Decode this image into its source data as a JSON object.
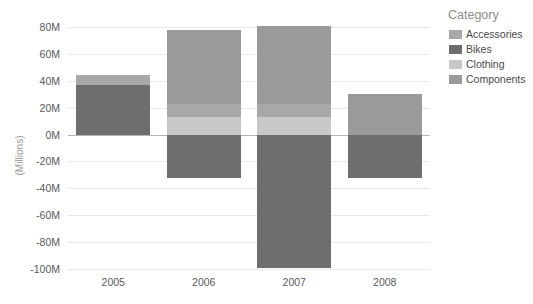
{
  "chart_data": {
    "type": "bar",
    "title": "",
    "subtitle": "",
    "xlabel": "",
    "ylabel": "(Millions)",
    "categories": [
      "2005",
      "2006",
      "2007",
      "2008"
    ],
    "ylim": [
      -100,
      80
    ],
    "ytick_values": [
      80,
      60,
      40,
      20,
      0,
      -20,
      -40,
      -60,
      -80,
      -100
    ],
    "ytick_labels": [
      "80M",
      "60M",
      "40M",
      "20M",
      "0M",
      "-20M",
      "-40M",
      "-60M",
      "-80M",
      "-100M"
    ],
    "grid": true,
    "stacked": true,
    "legend_position": "right",
    "legend_title": "Category",
    "series": [
      {
        "name": "Accessories",
        "color": "#a8a8a8",
        "values": [
          7,
          10,
          10,
          0
        ]
      },
      {
        "name": "Bikes",
        "color": "#6e6e6e",
        "values": [
          37,
          -32,
          -99,
          -32
        ]
      },
      {
        "name": "Clothing",
        "color": "#c8c8c8",
        "values": [
          0,
          13,
          13,
          0
        ]
      },
      {
        "name": "Components",
        "color": "#9a9a9a",
        "values": [
          0,
          55,
          58,
          30
        ]
      }
    ],
    "bar_totals_positive": [
      44,
      78,
      81,
      30
    ],
    "bar_totals_negative": [
      0,
      -32,
      -99,
      -32
    ]
  },
  "legend": {
    "title": "Category",
    "items": [
      {
        "label": "Accessories",
        "color": "#a8a8a8"
      },
      {
        "label": "Bikes",
        "color": "#6e6e6e"
      },
      {
        "label": "Clothing",
        "color": "#c8c8c8"
      },
      {
        "label": "Components",
        "color": "#9a9a9a"
      }
    ]
  },
  "axes": {
    "y_title": "(Millions)",
    "y_ticks": [
      "80M",
      "60M",
      "40M",
      "20M",
      "0M",
      "-20M",
      "-40M",
      "-60M",
      "-80M",
      "-100M"
    ],
    "x_ticks": [
      "2005",
      "2006",
      "2007",
      "2008"
    ]
  },
  "colors": {
    "background": "#ffffff",
    "gridline": "#e9e9e9",
    "zeroline": "#b6b6b6",
    "tick_text": "#5a5a5a",
    "axis_title": "#9a9a9a",
    "legend_title": "#8d8d8d"
  }
}
